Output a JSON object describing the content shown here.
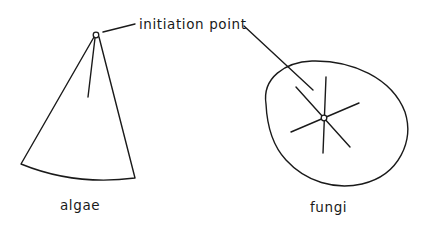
{
  "diagram": {
    "title": "",
    "labels": {
      "initiation_point": "initiation point",
      "algae": "algae",
      "fungi": "fungi"
    },
    "shapes": [
      {
        "id": "algae",
        "form": "fan / sector with single radial line from apex",
        "initiation_point": "apex of fan"
      },
      {
        "id": "fungi",
        "form": "irregular rounded outline with radiating spokes",
        "spokes": 3,
        "initiation_point": "center of spokes"
      }
    ],
    "colors": {
      "line": "#1a1a1a",
      "background": "#ffffff"
    }
  }
}
